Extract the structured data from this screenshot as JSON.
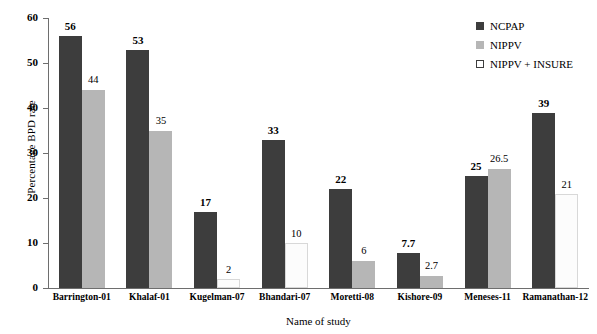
{
  "chart_data": {
    "type": "bar",
    "title": "",
    "xlabel": "Name of study",
    "ylabel": "Percentage BPD rate",
    "ylim": [
      0,
      60
    ],
    "yticks": [
      0,
      10,
      20,
      30,
      40,
      50,
      60
    ],
    "grid": false,
    "legend_position": "top-right",
    "categories": [
      "Barrington-01",
      "Khalaf-01",
      "Kugelman-07",
      "Bhandari-07",
      "Moretti-08",
      "Kishore-09",
      "Meneses-11",
      "Ramanathan-12"
    ],
    "series": [
      {
        "name": "NCPAP",
        "color": "#3d3d3d",
        "values": [
          56,
          53,
          17,
          33,
          22,
          7.7,
          25,
          39
        ],
        "labels": [
          "56",
          "53",
          "17",
          "33",
          "22",
          "7.7",
          "25",
          "39"
        ]
      },
      {
        "name": "NIPPV",
        "color": "#b6b6b6",
        "values": [
          44,
          35,
          null,
          null,
          6,
          2.7,
          26.5,
          null
        ],
        "labels": [
          "44",
          "35",
          null,
          null,
          "6",
          "2.7",
          "26.5",
          null
        ]
      },
      {
        "name": "NIPPV + INSURE",
        "color": "#ffffff",
        "values": [
          null,
          null,
          2,
          10,
          null,
          null,
          null,
          21
        ],
        "labels": [
          null,
          null,
          "2",
          "10",
          null,
          null,
          null,
          "21"
        ]
      }
    ]
  },
  "legend": {
    "items": [
      {
        "label": "NCPAP",
        "swatch": "s-ncpap"
      },
      {
        "label": "NIPPV",
        "swatch": "s-nippv"
      },
      {
        "label": "NIPPV + INSURE",
        "swatch": "s-insure"
      }
    ]
  }
}
